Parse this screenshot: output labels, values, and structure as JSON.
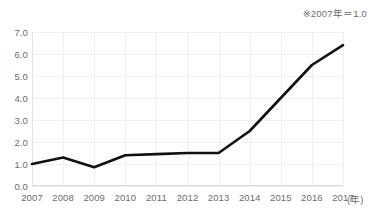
{
  "title": "",
  "note": "※2007年＝1.0",
  "axis": {
    "x_unit": "(年)",
    "y_ticks": [
      "0.0",
      "1.0",
      "2.0",
      "3.0",
      "4.0",
      "5.0",
      "6.0",
      "7.0"
    ],
    "x_ticks": [
      "2007",
      "2008",
      "2009",
      "2010",
      "2011",
      "2012",
      "2013",
      "2014",
      "2015",
      "2016",
      "2017"
    ]
  },
  "style": {
    "line_color": "#111111",
    "grid_color": "#f0f0f0",
    "axis_color": "#dcdcdc",
    "text_color": "#6b6b6b",
    "background": "#ffffff"
  },
  "chart_data": {
    "type": "line",
    "title": "",
    "xlabel": "(年)",
    "ylabel": "",
    "x": [
      2007,
      2008,
      2009,
      2010,
      2011,
      2012,
      2013,
      2014,
      2015,
      2016,
      2017
    ],
    "categories": [
      "2007",
      "2008",
      "2009",
      "2010",
      "2011",
      "2012",
      "2013",
      "2014",
      "2015",
      "2016",
      "2017"
    ],
    "values": [
      1.0,
      1.3,
      0.85,
      1.4,
      1.45,
      1.5,
      1.5,
      2.5,
      4.0,
      5.5,
      6.4
    ],
    "series": [
      {
        "name": "指数",
        "values": [
          1.0,
          1.3,
          0.85,
          1.4,
          1.45,
          1.5,
          1.5,
          2.5,
          4.0,
          5.5,
          6.4
        ]
      }
    ],
    "ylim": [
      0.0,
      7.0
    ],
    "xlim": [
      2007,
      2017
    ],
    "ytick_step": 1.0,
    "grid": true,
    "legend": false,
    "annotations": [
      "※2007年＝1.0"
    ]
  }
}
